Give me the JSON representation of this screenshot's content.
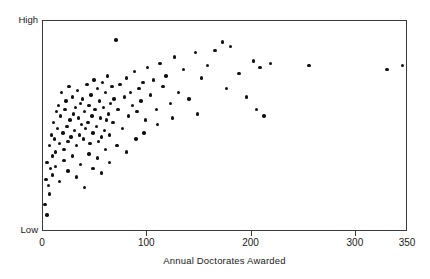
{
  "chart_data": {
    "type": "scatter",
    "title": "",
    "xlabel": "Annual Doctorates Awarded",
    "ylabel": "Institutional Quality Rating",
    "xlim": [
      0,
      350
    ],
    "ylim": [
      0,
      100
    ],
    "grid": false,
    "legend": null,
    "xticks": [
      {
        "value": 0,
        "label": "0"
      },
      {
        "value": 100,
        "label": "100"
      },
      {
        "value": 200,
        "label": "200"
      },
      {
        "value": 300,
        "label": "300"
      },
      {
        "value": 350,
        "label": "350"
      }
    ],
    "yticks": [
      {
        "value": 100,
        "label": "High"
      },
      {
        "value": 0,
        "label": "Low"
      }
    ],
    "marker": "filled-circle",
    "marker_color": "#111111",
    "axis_color": "#3a3a3a",
    "background_color": "#ffffff",
    "n_points": 126,
    "points": [
      [
        2,
        13
      ],
      [
        3,
        25
      ],
      [
        4,
        33
      ],
      [
        5,
        22
      ],
      [
        6,
        41
      ],
      [
        4,
        8
      ],
      [
        7,
        30
      ],
      [
        8,
        46
      ],
      [
        9,
        36
      ],
      [
        6,
        18
      ],
      [
        10,
        52
      ],
      [
        11,
        44
      ],
      [
        12,
        38
      ],
      [
        13,
        57
      ],
      [
        9,
        27
      ],
      [
        14,
        49
      ],
      [
        15,
        60
      ],
      [
        16,
        42
      ],
      [
        12,
        31
      ],
      [
        17,
        55
      ],
      [
        18,
        66
      ],
      [
        19,
        47
      ],
      [
        20,
        39
      ],
      [
        21,
        58
      ],
      [
        16,
        24
      ],
      [
        22,
        62
      ],
      [
        23,
        50
      ],
      [
        24,
        43
      ],
      [
        25,
        69
      ],
      [
        20,
        34
      ],
      [
        26,
        53
      ],
      [
        27,
        45
      ],
      [
        28,
        64
      ],
      [
        29,
        56
      ],
      [
        24,
        29
      ],
      [
        30,
        48
      ],
      [
        31,
        59
      ],
      [
        32,
        41
      ],
      [
        33,
        67
      ],
      [
        28,
        36
      ],
      [
        34,
        54
      ],
      [
        35,
        46
      ],
      [
        36,
        61
      ],
      [
        37,
        51
      ],
      [
        32,
        26
      ],
      [
        38,
        63
      ],
      [
        39,
        44
      ],
      [
        40,
        57
      ],
      [
        41,
        49
      ],
      [
        36,
        32
      ],
      [
        42,
        70
      ],
      [
        43,
        52
      ],
      [
        44,
        60
      ],
      [
        45,
        42
      ],
      [
        40,
        21
      ],
      [
        46,
        65
      ],
      [
        47,
        55
      ],
      [
        48,
        47
      ],
      [
        49,
        72
      ],
      [
        44,
        37
      ],
      [
        50,
        58
      ],
      [
        51,
        50
      ],
      [
        52,
        68
      ],
      [
        53,
        43
      ],
      [
        48,
        30
      ],
      [
        54,
        62
      ],
      [
        55,
        54
      ],
      [
        56,
        45
      ],
      [
        57,
        71
      ],
      [
        52,
        35
      ],
      [
        58,
        59
      ],
      [
        59,
        48
      ],
      [
        60,
        66
      ],
      [
        61,
        53
      ],
      [
        56,
        28
      ],
      [
        62,
        74
      ],
      [
        63,
        56
      ],
      [
        64,
        46
      ],
      [
        65,
        61
      ],
      [
        60,
        39
      ],
      [
        66,
        69
      ],
      [
        67,
        52
      ],
      [
        68,
        63
      ],
      [
        70,
        91
      ],
      [
        64,
        33
      ],
      [
        72,
        58
      ],
      [
        74,
        70
      ],
      [
        76,
        49
      ],
      [
        78,
        64
      ],
      [
        71,
        41
      ],
      [
        80,
        73
      ],
      [
        82,
        55
      ],
      [
        84,
        66
      ],
      [
        86,
        60
      ],
      [
        80,
        38
      ],
      [
        88,
        76
      ],
      [
        90,
        57
      ],
      [
        92,
        68
      ],
      [
        94,
        62
      ],
      [
        89,
        44
      ],
      [
        96,
        71
      ],
      [
        98,
        53
      ],
      [
        100,
        78
      ],
      [
        103,
        65
      ],
      [
        97,
        47
      ],
      [
        106,
        72
      ],
      [
        109,
        58
      ],
      [
        112,
        80
      ],
      [
        115,
        69
      ],
      [
        110,
        51
      ],
      [
        118,
        74
      ],
      [
        122,
        61
      ],
      [
        126,
        83
      ],
      [
        130,
        66
      ],
      [
        124,
        54
      ],
      [
        135,
        77
      ],
      [
        140,
        63
      ],
      [
        146,
        85
      ],
      [
        152,
        73
      ],
      [
        148,
        56
      ],
      [
        158,
        79
      ],
      [
        165,
        86
      ],
      [
        172,
        90
      ],
      [
        180,
        88
      ],
      [
        176,
        68
      ],
      [
        188,
        75
      ],
      [
        195,
        64
      ],
      [
        202,
        81
      ],
      [
        208,
        78
      ],
      [
        205,
        58
      ],
      [
        212,
        55
      ],
      [
        218,
        80
      ],
      [
        255,
        79
      ],
      [
        330,
        77
      ],
      [
        345,
        79
      ]
    ]
  }
}
